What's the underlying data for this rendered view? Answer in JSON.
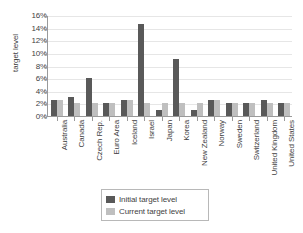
{
  "chart_data": {
    "type": "bar",
    "title": "",
    "xlabel": "",
    "ylabel": "target level",
    "ylim": [
      0,
      16
    ],
    "ytick_labels": [
      "16%",
      "14%",
      "12%",
      "10%",
      "8%",
      "6%",
      "4%",
      "2%",
      "0%"
    ],
    "ytick_values": [
      16,
      14,
      12,
      10,
      8,
      6,
      4,
      2,
      0
    ],
    "grid": true,
    "legend_position": "bottom",
    "categories": [
      "Australia",
      "Canada",
      "Czech Rep.",
      "Euro Area",
      "Iceland",
      "Israel",
      "Japan",
      "Korea",
      "New Zealand",
      "Norway",
      "Sweden",
      "Switzerland",
      "United Kingdom",
      "United States"
    ],
    "series": [
      {
        "name": "Initial target level",
        "color": "#595959",
        "values": [
          2.5,
          3.0,
          6.0,
          2.0,
          2.5,
          14.5,
          1.0,
          9.0,
          1.0,
          2.5,
          2.0,
          2.0,
          2.5,
          2.0
        ]
      },
      {
        "name": "Current target level",
        "color": "#bfbfbf",
        "values": [
          2.5,
          2.0,
          2.0,
          2.0,
          2.5,
          2.0,
          2.0,
          2.0,
          2.0,
          2.5,
          2.0,
          2.0,
          2.0,
          2.0
        ]
      }
    ]
  },
  "legend": {
    "items": [
      {
        "label": "Initial target level"
      },
      {
        "label": "Current target level"
      }
    ]
  },
  "colors": {
    "initial": "#595959",
    "current": "#bfbfbf",
    "axis": "#9a9a9a",
    "grid": "#e6e6e6",
    "text": "#3f3f3f"
  }
}
